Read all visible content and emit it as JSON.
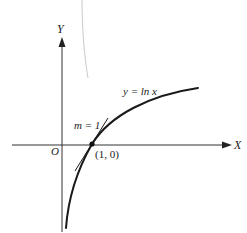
{
  "diagram": {
    "axes": {
      "x_label": "X",
      "y_label": "Y",
      "origin_label": "O"
    },
    "curve": {
      "label": "y = ln x",
      "function": "ln x"
    },
    "tangent": {
      "label": "m = 1",
      "slope": 1
    },
    "point": {
      "label": "(1, 0)",
      "x": 1,
      "y": 0
    },
    "colors": {
      "stroke": "#1a1a1a",
      "axis": "#333333",
      "artifact": "#bbbbbb"
    }
  }
}
